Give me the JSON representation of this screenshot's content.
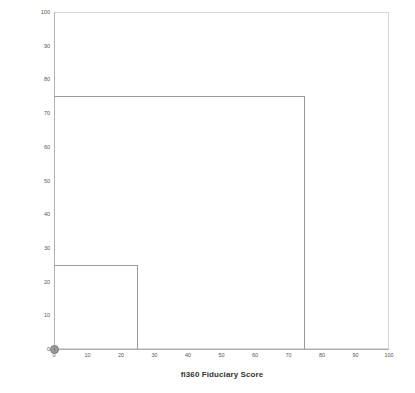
{
  "chart_data": {
    "type": "line",
    "title": "",
    "xlabel": "fi360 Fiduciary Score",
    "ylabel": "fi360 Fiduciary Score Average (3-Year)",
    "xlim": [
      0,
      100
    ],
    "ylim": [
      0,
      100
    ],
    "xticks": [
      0,
      10,
      20,
      30,
      40,
      50,
      60,
      70,
      80,
      90,
      100
    ],
    "yticks": [
      0,
      10,
      20,
      30,
      40,
      50,
      60,
      70,
      80,
      90,
      100
    ],
    "xtick_labels": [
      "0",
      "10",
      "20",
      "30",
      "40",
      "50",
      "60",
      "70",
      "80",
      "90",
      "100"
    ],
    "ytick_labels": [
      "0",
      "10",
      "20",
      "30",
      "40",
      "50",
      "60",
      "70",
      "80",
      "90",
      "100"
    ],
    "grid": false,
    "legend": null,
    "series": [
      {
        "name": "outer-step",
        "type": "step",
        "color": "#9a9a9a",
        "points": [
          [
            0,
            75
          ],
          [
            75,
            75
          ],
          [
            75,
            0
          ]
        ]
      },
      {
        "name": "inner-step",
        "type": "step",
        "color": "#9a9a9a",
        "points": [
          [
            0,
            25
          ],
          [
            25,
            25
          ],
          [
            25,
            0
          ]
        ]
      }
    ],
    "markers": [
      {
        "name": "origin-point",
        "x": 0,
        "y": 0,
        "color": "#9b9b9b"
      }
    ]
  },
  "axes": {
    "y_title": "fi360 Fiduciary Score Average (3-Year)",
    "x_title": "fi360 Fiduciary Score"
  },
  "colors": {
    "series_line": "#9a9a9a",
    "frame": "#d6d6d6",
    "spine": "#b0b0b0",
    "tick_text": "#555555",
    "title_text": "#333333",
    "background": "#ffffff"
  }
}
